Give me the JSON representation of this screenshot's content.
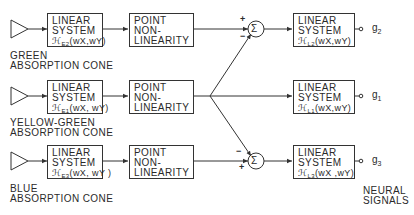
{
  "diagram": {
    "type": "block-diagram",
    "rows": [
      {
        "id": "green",
        "cone_label_line1": "GREEN",
        "cone_label_line2": "ABSORPTION CONE",
        "linear_line1": "LINEAR",
        "linear_line2": "SYSTEM",
        "linear_func": "ℋ",
        "linear_sub": "E2",
        "linear_args": "(wX,wY)",
        "point_line1": "POINT",
        "point_line2": "NON-",
        "point_line3": "LINEARITY",
        "out_linear_func": "ℋ",
        "out_linear_sub": "L2",
        "out_linear_args": "(wX,wY)",
        "output": "g",
        "output_sub": "2"
      },
      {
        "id": "yellow-green",
        "cone_label_line1": "YELLOW-GREEN",
        "cone_label_line2": "ABSORPTION CONE",
        "linear_line1": "LINEAR",
        "linear_line2": "SYSTEM",
        "linear_func": "ℋ",
        "linear_sub": "E1",
        "linear_args": "(wX, wY)",
        "point_line1": "POINT",
        "point_line2": "NON-",
        "point_line3": "LINEARITY",
        "out_linear_func": "ℋ",
        "out_linear_sub": "L1",
        "out_linear_args": "(wX,wY)",
        "output": "g",
        "output_sub": "1"
      },
      {
        "id": "blue",
        "cone_label_line1": "BLUE",
        "cone_label_line2": "ABSORPTION CONE",
        "linear_line1": "LINEAR",
        "linear_line2": "SYSTEM",
        "linear_func": "ℋ",
        "linear_sub": "E3",
        "linear_args": "(wX, wY )",
        "point_line1": "POINT",
        "point_line2": "NON-",
        "point_line3": "LINEARITY",
        "out_linear_func": "ℋ",
        "out_linear_sub": "L3",
        "out_linear_args": "(wX ,wY)",
        "output": "g",
        "output_sub": "3"
      }
    ],
    "summers": [
      {
        "symbol": "Σ",
        "top_sign": "+",
        "bottom_sign": "−"
      },
      {
        "symbol": "Σ",
        "top_sign": "−",
        "bottom_sign": "+"
      }
    ],
    "output_label_line1": "NEURAL",
    "output_label_line2": "SIGNALS",
    "line_color": "#333333"
  }
}
